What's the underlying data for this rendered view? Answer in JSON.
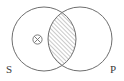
{
  "diagram": {
    "type": "venn-euler-syllogism",
    "title": "",
    "background_color": "#ffffff",
    "stroke_color": "#6e6e6e",
    "hatch_color": "#8a8a8a",
    "label_color": "#3a3a3a",
    "circles": [
      {
        "id": "circle-s",
        "label": "S",
        "cx": 44,
        "cy": 39,
        "r": 32,
        "label_x": 6,
        "label_y": 73
      },
      {
        "id": "circle-p",
        "label": "P",
        "cx": 80,
        "cy": 39,
        "r": 32,
        "label_x": 110,
        "label_y": 73
      }
    ],
    "intersection": {
      "id": "lens-region",
      "fill": "hatched",
      "hatch_direction": "forward-slash",
      "hatch_spacing": 3,
      "hatch_angle_deg": 45
    },
    "markers": [
      {
        "id": "cross-marker",
        "symbol": "⊗",
        "name": "circled-x-marker",
        "cx": 37.5,
        "cy": 39.5,
        "r": 5,
        "region": "S-only"
      }
    ],
    "labels": {
      "subject": "S",
      "predicate": "P"
    }
  }
}
